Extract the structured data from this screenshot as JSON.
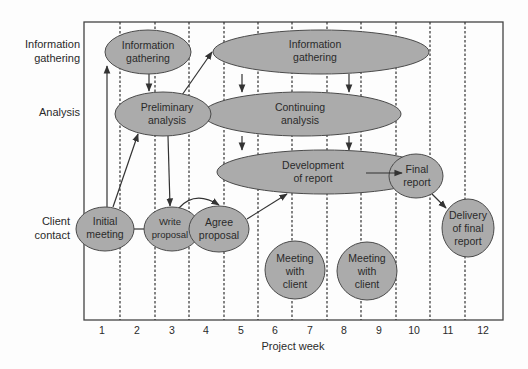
{
  "diagram": {
    "row_labels": [
      {
        "id": "info",
        "lines": [
          "Information",
          "gathering"
        ]
      },
      {
        "id": "analysis",
        "lines": [
          "Analysis"
        ]
      },
      {
        "id": "client",
        "lines": [
          "Client",
          "contact"
        ]
      }
    ],
    "x_axis": {
      "title": "Project week",
      "ticks": [
        "1",
        "2",
        "3",
        "4",
        "5",
        "6",
        "7",
        "8",
        "9",
        "10",
        "11",
        "12"
      ]
    },
    "nodes": [
      {
        "id": "info-gathering-1",
        "lines": [
          "Information",
          "gathering"
        ],
        "row": "info",
        "weeks": "1-3"
      },
      {
        "id": "info-gathering-2",
        "lines": [
          "Information",
          "gathering"
        ],
        "row": "info",
        "weeks": "4-10"
      },
      {
        "id": "preliminary-analysis",
        "lines": [
          "Preliminary",
          "analysis"
        ],
        "row": "analysis",
        "weeks": "2-4"
      },
      {
        "id": "continuing-analysis",
        "lines": [
          "Continuing",
          "analysis"
        ],
        "row": "analysis",
        "weeks": "4-9"
      },
      {
        "id": "development-of-report",
        "lines": [
          "Development",
          "of report"
        ],
        "row": "report",
        "weeks": "5-10"
      },
      {
        "id": "final-report",
        "lines": [
          "Final",
          "report"
        ],
        "row": "report",
        "weeks": "10"
      },
      {
        "id": "initial-meeting",
        "lines": [
          "Initial",
          "meeting"
        ],
        "row": "client",
        "weeks": "1"
      },
      {
        "id": "write-proposal",
        "lines": [
          "Write",
          "proposal"
        ],
        "row": "client",
        "weeks": "3"
      },
      {
        "id": "agree-proposal",
        "lines": [
          "Agree",
          "proposal"
        ],
        "row": "client",
        "weeks": "4"
      },
      {
        "id": "meeting-with-client-1",
        "lines": [
          "Meeting",
          "with",
          "client"
        ],
        "row": "client",
        "weeks": "6-7"
      },
      {
        "id": "meeting-with-client-2",
        "lines": [
          "Meeting",
          "with",
          "client"
        ],
        "row": "client",
        "weeks": "8-9"
      },
      {
        "id": "delivery-of-final-report",
        "lines": [
          "Delivery",
          "of final",
          "report"
        ],
        "row": "client",
        "weeks": "11-12"
      }
    ],
    "edges": [
      {
        "from": "initial-meeting",
        "to": "info-gathering-1"
      },
      {
        "from": "initial-meeting",
        "to": "preliminary-analysis"
      },
      {
        "from": "initial-meeting",
        "to": "write-proposal"
      },
      {
        "from": "info-gathering-1",
        "to": "preliminary-analysis"
      },
      {
        "from": "preliminary-analysis",
        "to": "info-gathering-2"
      },
      {
        "from": "preliminary-analysis",
        "to": "write-proposal"
      },
      {
        "from": "write-proposal",
        "to": "agree-proposal"
      },
      {
        "from": "agree-proposal",
        "to": "development-of-report"
      },
      {
        "from": "info-gathering-2",
        "to": "continuing-analysis"
      },
      {
        "from": "continuing-analysis",
        "to": "development-of-report"
      },
      {
        "from": "development-of-report",
        "to": "final-report"
      },
      {
        "from": "final-report",
        "to": "delivery-of-final-report"
      }
    ],
    "colors": {
      "node_fill": "#ababab",
      "node_stroke": "#4a4a4a",
      "line": "#333333",
      "text": "#2a2a2a"
    }
  }
}
